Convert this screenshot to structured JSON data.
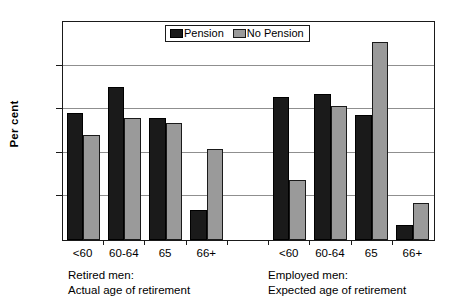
{
  "chart_data": {
    "type": "bar",
    "title": "",
    "xlabel": "",
    "ylabel": "Per cent",
    "ylim": [
      0,
      50
    ],
    "yticks": [
      0,
      10,
      20,
      30,
      40,
      50
    ],
    "grid": true,
    "legend_position": "top-center",
    "categories": [
      "<60",
      "60-64",
      "65",
      "66+",
      "<60",
      "60-64",
      "65",
      "66+"
    ],
    "groups": [
      {
        "caption_line1": "Retired men:",
        "caption_line2": "Actual age of retirement",
        "categories": [
          "<60",
          "60-64",
          "65",
          "66+"
        ]
      },
      {
        "caption_line1": "Employed men:",
        "caption_line2": "Expected age of retirement",
        "categories": [
          "<60",
          "60-64",
          "65",
          "66+"
        ]
      }
    ],
    "series": [
      {
        "name": "Pension",
        "color": "#1a1a1a",
        "values": [
          29.1,
          35.1,
          28.0,
          6.9,
          32.8,
          33.6,
          28.7,
          3.4
        ]
      },
      {
        "name": "No Pension",
        "color": "#9a9a9a",
        "values": [
          24.0,
          27.9,
          26.8,
          20.8,
          13.7,
          30.7,
          45.4,
          8.6
        ]
      }
    ]
  },
  "legend": {
    "entries": [
      {
        "label": "Pension",
        "swatch": "pension"
      },
      {
        "label": "No Pension",
        "swatch": "nopension"
      }
    ]
  }
}
